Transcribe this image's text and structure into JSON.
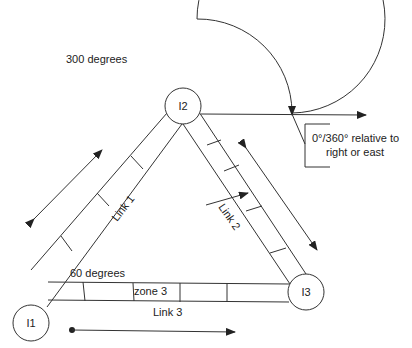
{
  "labels": {
    "angle_300": "300 degrees",
    "angle_60": "60 degrees",
    "reference_line1": "0°/360° relative to",
    "reference_line2": "right or east",
    "link1": "Link 1",
    "link2": "Link 2",
    "link3": "Link 3",
    "zone3": "zone 3"
  },
  "nodes": [
    {
      "id": "I1",
      "label": "I1"
    },
    {
      "id": "I2",
      "label": "I2"
    },
    {
      "id": "I3",
      "label": "I3"
    }
  ],
  "colors": {
    "stroke": "#333333",
    "text": "#222222",
    "background": "#ffffff"
  }
}
